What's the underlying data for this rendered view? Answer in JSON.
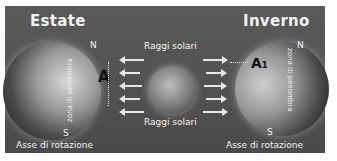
{
  "diagram": {
    "left": {
      "title": "Estate",
      "north": "N",
      "south": "S",
      "point": "A",
      "zone": "zona di penombra",
      "axis": "Asse di rotazione"
    },
    "right": {
      "title": "Inverno",
      "north": "N",
      "south": "S",
      "point": "A₁",
      "zone": "zona di penombra",
      "axis": "Asse di rotazione"
    },
    "center": {
      "rays_top": "Raggi solari",
      "rays_bottom": "Raggi solari"
    },
    "colors": {
      "background": "#505050",
      "text": "#f2f2f2"
    }
  }
}
